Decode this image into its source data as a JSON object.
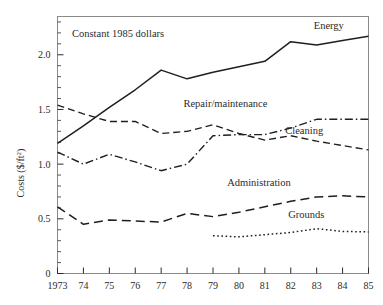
{
  "chart_data": {
    "type": "line",
    "title": "",
    "annotation": "Constant 1985 dollars",
    "xlabel": "",
    "ylabel": "Costs ($/ft²)",
    "ylabel_parts": {
      "base": "Costs ($/ft",
      "sup": "2",
      "tail": ")"
    },
    "x": [
      1973,
      1974,
      1975,
      1976,
      1977,
      1978,
      1979,
      1980,
      1981,
      1982,
      1983,
      1984,
      1985
    ],
    "xtick_labels": [
      "1973",
      "74",
      "75",
      "76",
      "77",
      "78",
      "79",
      "80",
      "81",
      "82",
      "83",
      "84",
      "85"
    ],
    "ytick_labels": [
      "0",
      "0.5",
      "1.0",
      "1.5",
      "2.0"
    ],
    "ytick_values": [
      0,
      0.5,
      1.0,
      1.5,
      2.0
    ],
    "ylim": [
      0,
      2.35
    ],
    "xlim": [
      1973,
      1985
    ],
    "grid": false,
    "legend_position": "inline-right-of-series",
    "series": [
      {
        "name": "Energy",
        "style": "solid",
        "label": "Energy",
        "label_x": 1984.05,
        "label_y": 2.24,
        "values": [
          1.19,
          1.35,
          1.52,
          1.68,
          1.86,
          1.78,
          1.84,
          1.89,
          1.94,
          2.12,
          2.09,
          2.13,
          2.17
        ]
      },
      {
        "name": "Cleaning",
        "style": "dashed",
        "label": "Cleaning",
        "label_x": 1983.25,
        "label_y": 1.28,
        "values": [
          1.54,
          1.46,
          1.39,
          1.39,
          1.28,
          1.3,
          1.36,
          1.28,
          1.22,
          1.26,
          1.21,
          1.17,
          1.13
        ]
      },
      {
        "name": "Repair/maintenance",
        "style": "dashdot",
        "label": "Repair/maintenance",
        "label_x": 1981.1,
        "label_y": 1.52,
        "values": [
          1.11,
          1.0,
          1.09,
          1.02,
          0.94,
          1.0,
          1.26,
          1.27,
          1.27,
          1.33,
          1.41,
          1.41,
          1.41
        ]
      },
      {
        "name": "Administration",
        "style": "longdash",
        "label": "Administration",
        "label_x": 1982.0,
        "label_y": 0.8,
        "values": [
          0.61,
          0.45,
          0.49,
          0.48,
          0.47,
          0.55,
          0.52,
          0.56,
          0.61,
          0.66,
          0.7,
          0.71,
          0.7
        ]
      },
      {
        "name": "Grounds",
        "style": "dotted",
        "label": "Grounds",
        "label_x": 1983.3,
        "label_y": 0.51,
        "start_index": 6,
        "values": [
          null,
          null,
          null,
          null,
          null,
          null,
          0.345,
          0.335,
          0.355,
          0.375,
          0.41,
          0.385,
          0.38
        ]
      }
    ],
    "colors": {
      "line": "#1f1f1f",
      "axis": "#2b2b2b",
      "frame": "#8a8a8a",
      "background": "#ffffff"
    }
  }
}
